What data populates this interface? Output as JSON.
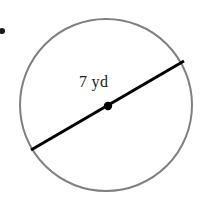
{
  "figure": {
    "type": "geometry-diagram",
    "shape": "circle",
    "background_color": "#ffffff",
    "canvas": {
      "width": 204,
      "height": 207
    },
    "circle": {
      "name": "circle-outline",
      "center_x": 106,
      "center_y": 105,
      "radius": 86,
      "stroke_color": "#808080",
      "stroke_width": 2,
      "fill": "none"
    },
    "diameter": {
      "name": "diameter-segment",
      "x1": 31,
      "y1": 150,
      "x2": 184,
      "y2": 61,
      "stroke_color": "#000000",
      "stroke_width": 3
    },
    "center_point": {
      "name": "center-dot",
      "x": 108,
      "y": 106,
      "radius": 4,
      "fill_color": "#000000"
    },
    "bullet_mark": {
      "name": "bullet-dot",
      "x": 2,
      "y": 31,
      "radius": 3,
      "fill_color": "#1a1a1a"
    },
    "label": {
      "name": "diameter-label",
      "text": "7 yd",
      "value": 7,
      "unit": "yd",
      "measurement": "diameter",
      "color": "#1a1a1a",
      "font_size_px": 16
    }
  }
}
